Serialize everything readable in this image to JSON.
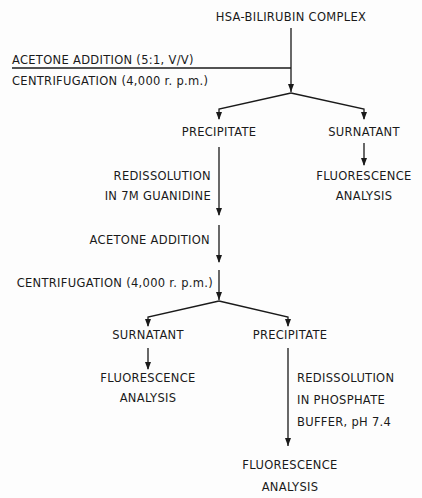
{
  "diagram": {
    "type": "flowchart",
    "title": "HSA-BILIRUBIN COMPLEX",
    "step1": {
      "acetone_label": "ACETONE  ADDITION  (5:1,  V/V)",
      "centrifugation_label": "CENTRIFUGATION (4,000 r. p.m.)"
    },
    "branch1": {
      "left": {
        "label": "PRECIPITATE",
        "redissolution_line1": "REDISSOLUTION",
        "redissolution_line2": "IN 7M GUANIDINE",
        "acetone_label": "ACETONE  ADDITION",
        "centrifugation_label": "CENTRIFUGATION (4,000 r. p.m.)"
      },
      "right": {
        "label": "SURNATANT",
        "result_line1": "FLUORESCENCE",
        "result_line2": "ANALYSIS"
      }
    },
    "branch2": {
      "left": {
        "label": "SURNATANT",
        "result_line1": "FLUORESCENCE",
        "result_line2": "ANALYSIS"
      },
      "right": {
        "label": "PRECIPITATE",
        "redissolution_line1": "REDISSOLUTION",
        "redissolution_line2": "IN  PHOSPHATE",
        "redissolution_line3": "BUFFER,  pH  7.4",
        "result_line1": "FLUORESCENCE",
        "result_line2": "ANALYSIS"
      }
    },
    "colors": {
      "ink": "#1a1a1a",
      "background": "#fdfdfd"
    }
  }
}
